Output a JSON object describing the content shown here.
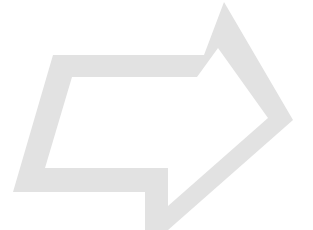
{
  "document": {
    "title": "Hollow Perspective Arrow",
    "background_color": "#ffffff",
    "width": 313,
    "height": 230
  },
  "graphic": {
    "name": "right-pointing-outline-arrow",
    "description": "Large light gray outlined arrow shape pointing to the right, drawn in skewed perspective with a hollow interior",
    "fill_color": "#e2e2e2",
    "stroke_color": "none",
    "direction": "right",
    "style": "outline",
    "band_thickness_px": 24,
    "outer_path": "M 224 2 L 293 120 L 168 230 L 145 230 L 145 192 L 13 192 L 53 55 L 204 55 Z",
    "inner_path": "M 218 48 L 268 118 L 168 206 L 168 168 L 45 168 L 72 77 L 197 77 Z"
  },
  "labels": {
    "shape_name": "Arrow",
    "empty_caption": ""
  }
}
